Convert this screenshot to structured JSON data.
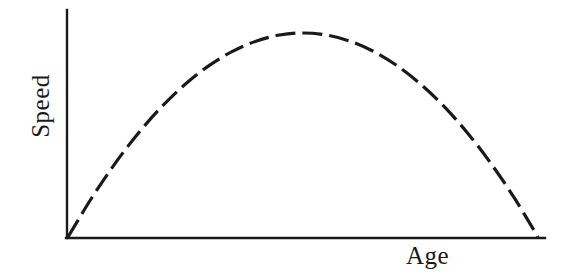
{
  "figure": {
    "background_color": "#ffffff",
    "ink_color": "#1a1a1a",
    "width": 564,
    "height": 276
  },
  "chart_data": {
    "type": "line",
    "title": "",
    "subtitle": "",
    "xlabel": "Age",
    "ylabel": "Speed",
    "grid": false,
    "legend": null,
    "annotations": [],
    "xlim": [
      0,
      1
    ],
    "ylim": [
      0,
      1
    ],
    "xticks": [],
    "yticks": [],
    "xticklabels": [],
    "yticklabels": [],
    "axis_style": {
      "spines": [
        "left",
        "bottom"
      ],
      "arrowheads": false,
      "stroke_width": 2.2
    },
    "series": [
      {
        "name": "Speed vs Age",
        "linestyle": "dashed",
        "dash_pattern": [
          20,
          7
        ],
        "stroke_width": 3.2,
        "color": "#1a1a1a",
        "marker": "none",
        "shape": "inverted-parabola",
        "x": [
          0.0,
          0.05,
          0.1,
          0.15,
          0.2,
          0.25,
          0.3,
          0.35,
          0.4,
          0.45,
          0.5,
          0.55,
          0.6,
          0.65,
          0.7,
          0.75,
          0.8,
          0.85,
          0.9,
          0.95,
          1.0
        ],
        "y": [
          0.0,
          0.19,
          0.36,
          0.51,
          0.64,
          0.75,
          0.84,
          0.91,
          0.96,
          0.99,
          1.0,
          0.99,
          0.96,
          0.91,
          0.84,
          0.75,
          0.64,
          0.51,
          0.36,
          0.19,
          0.0
        ],
        "peak": {
          "x": 0.5,
          "y": 1.0
        }
      }
    ]
  },
  "labels": {
    "y_axis": "Speed",
    "x_axis": "Age"
  }
}
